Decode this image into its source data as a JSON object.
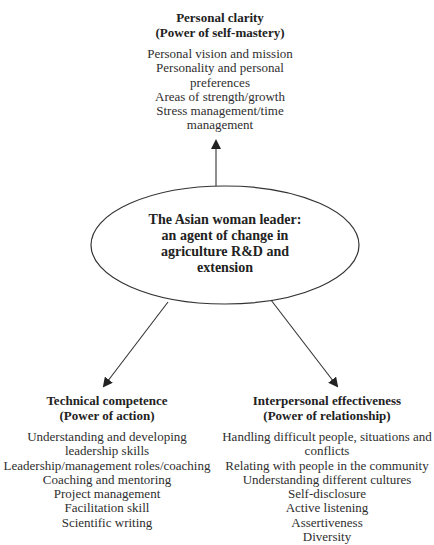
{
  "center": {
    "lines": [
      "The Asian woman leader:",
      "an agent of change in",
      "agriculture R&D and",
      "extension"
    ]
  },
  "top": {
    "title": "Personal clarity",
    "subtitle": "(Power of self-mastery)",
    "items": [
      "Personal vision and mission",
      "Personality and personal preferences",
      "Areas of strength/growth",
      "Stress management/time management"
    ]
  },
  "left": {
    "title": "Technical competence",
    "subtitle": "(Power of action)",
    "items": [
      "Understanding and developing leadership skills",
      "Leadership/management roles/coaching",
      "Coaching and mentoring",
      "Project management",
      "Facilitation skill",
      "Scientific writing"
    ]
  },
  "right": {
    "title": "Interpersonal effectiveness",
    "subtitle": "(Power of relationship)",
    "items": [
      "Handling difficult people, situations and conflicts",
      "Relating with people in the community",
      "Understanding different cultures",
      "Self-disclosure",
      "Active listening",
      "Assertiveness",
      "Diversity"
    ]
  },
  "colors": {
    "stroke": "#333333",
    "text": "#2a2a2a"
  }
}
